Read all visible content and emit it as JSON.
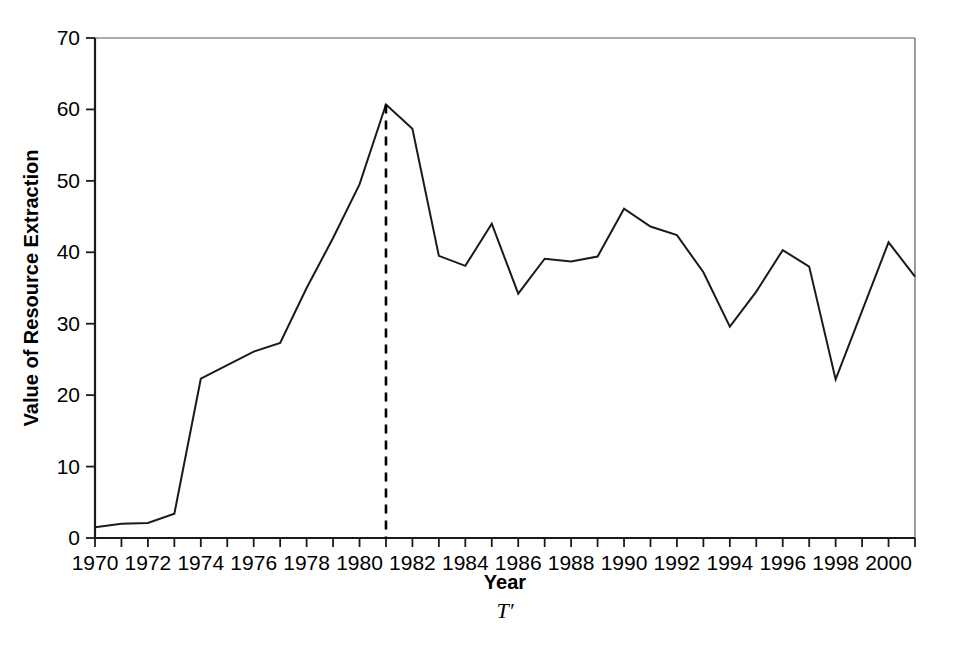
{
  "chart_data": {
    "type": "line",
    "title": "",
    "xlabel": "Year",
    "ylabel": "Value of Resource Extraction",
    "xlim": [
      1970,
      2001
    ],
    "ylim": [
      0,
      70
    ],
    "grid": false,
    "legend": null,
    "x_tick_labels": [
      "1970",
      "1972",
      "1974",
      "1976",
      "1978",
      "1980",
      "1982",
      "1984",
      "1986",
      "1988",
      "1990",
      "1992",
      "1994",
      "1996",
      "1998",
      "2000"
    ],
    "x_tick_values": [
      1970,
      1972,
      1974,
      1976,
      1978,
      1980,
      1982,
      1984,
      1986,
      1988,
      1990,
      1992,
      1994,
      1996,
      1998,
      2000
    ],
    "x_minor_ticks": [
      1971,
      1973,
      1975,
      1977,
      1979,
      1981,
      1983,
      1985,
      1987,
      1989,
      1991,
      1993,
      1995,
      1997,
      1999,
      2001
    ],
    "y_tick_labels": [
      "0",
      "10",
      "20",
      "30",
      "40",
      "50",
      "60",
      "70"
    ],
    "y_tick_values": [
      0,
      10,
      20,
      30,
      40,
      50,
      60,
      70
    ],
    "x": [
      1970,
      1971,
      1972,
      1973,
      1974,
      1975,
      1976,
      1977,
      1978,
      1979,
      1980,
      1981,
      1982,
      1983,
      1984,
      1985,
      1986,
      1987,
      1988,
      1989,
      1990,
      1991,
      1992,
      1993,
      1994,
      1995,
      1996,
      1997,
      1998,
      1999,
      2000,
      2001
    ],
    "values": [
      1.5,
      2.0,
      2.1,
      3.4,
      22.3,
      24.2,
      26.1,
      27.3,
      35.0,
      42.0,
      49.5,
      60.7,
      57.3,
      39.5,
      38.1,
      44.0,
      34.2,
      39.1,
      38.7,
      39.4,
      46.1,
      43.6,
      42.4,
      37.2,
      29.6,
      34.5,
      40.3,
      38.0,
      22.2,
      31.8,
      41.4,
      36.6
    ],
    "series_name": "Value of Resource Extraction",
    "annotations": [
      {
        "name": "t-prime-marker",
        "label": "T′",
        "type": "vertical-dashed-line",
        "x": 1981,
        "y_top": 60.7,
        "y_bottom": 0
      }
    ],
    "line_color": "#1a1a1a"
  },
  "axes": {
    "y_axis_title": "Value of Resource Extraction",
    "x_axis_title": "Year",
    "marker_caption": "T′"
  }
}
